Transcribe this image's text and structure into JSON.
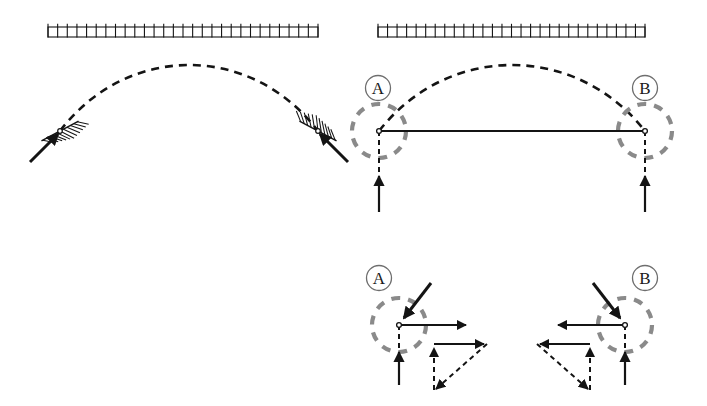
{
  "figure": {
    "colors": {
      "stroke": "#141414",
      "gray_dashed": "#8a8a8a",
      "label_circle": "#6e6e6e",
      "background": "#ffffff"
    }
  },
  "panels": [
    {
      "id": "panel-left",
      "name": "arch-on-fixed-abutments",
      "caption": "",
      "ceiling": {
        "name": "hatched-ground-bar",
        "x": 48,
        "y": 27,
        "width": 270,
        "height": 10,
        "tick_count": 28
      },
      "arch": {
        "name": "dashed-arch-curve",
        "start": [
          60,
          131
        ],
        "apex": [
          189,
          49
        ],
        "end": [
          318,
          131
        ],
        "style": "dashed"
      },
      "supports": [
        {
          "name": "left-inclined-abutment",
          "joint": [
            60,
            131
          ],
          "hatch_angle_deg": -28,
          "thrust_arrow": {
            "from": [
              30,
              162
            ],
            "to": [
              58,
              134
            ],
            "style": "solid"
          }
        },
        {
          "name": "right-inclined-abutment",
          "joint": [
            318,
            131
          ],
          "hatch_angle_deg": 28,
          "thrust_arrow": {
            "from": [
              348,
              162
            ],
            "to": [
              320,
              134
            ],
            "style": "solid"
          }
        }
      ]
    },
    {
      "id": "panel-right",
      "name": "tied-arch-with-reactions",
      "caption": "",
      "ceiling": {
        "name": "hatched-ground-bar",
        "x": 378,
        "y": 27,
        "width": 267,
        "height": 10,
        "tick_count": 28
      },
      "arch": {
        "name": "dashed-arch-curve",
        "start": [
          379,
          131
        ],
        "apex": [
          512,
          49
        ],
        "end": [
          645,
          131
        ],
        "style": "dashed"
      },
      "tie_rod": {
        "name": "horizontal-tie-rod",
        "from": [
          379,
          131
        ],
        "to": [
          645,
          131
        ],
        "style": "solid"
      },
      "joints": [
        {
          "name": "joint-a",
          "label": "A",
          "label_pos": [
            378,
            88
          ],
          "center": [
            379,
            131
          ],
          "circle_radius": 27
        },
        {
          "name": "joint-b",
          "label": "B",
          "label_pos": [
            645,
            88
          ],
          "center": [
            645,
            131
          ],
          "circle_radius": 27
        }
      ],
      "reactions": [
        {
          "name": "reaction-arrow-a",
          "dashed_line": {
            "from": [
              379,
              131
            ],
            "to": [
              379,
              205
            ]
          },
          "arrow": {
            "from": [
              379,
              212
            ],
            "to": [
              379,
              176
            ]
          }
        },
        {
          "name": "reaction-arrow-b",
          "dashed_line": {
            "from": [
              645,
              131
            ],
            "to": [
              645,
              205
            ]
          },
          "arrow": {
            "from": [
              645,
              212
            ],
            "to": [
              645,
              176
            ]
          }
        }
      ]
    },
    {
      "id": "panel-detail-a",
      "name": "free-body-detail-a",
      "label": "A",
      "label_pos": [
        379,
        278
      ],
      "center": [
        399,
        325
      ],
      "circle_radius": 27,
      "forces": {
        "applied_thrust": {
          "name": "arch-thrust-arrow",
          "from": [
            431,
            283
          ],
          "to": [
            404,
            318
          ],
          "style": "solid"
        },
        "tie_force": {
          "name": "tie-force-arrow",
          "from": [
            399,
            325
          ],
          "to": [
            466,
            325
          ],
          "style": "solid"
        },
        "reaction_vertical": {
          "name": "vertical-reaction-arrow",
          "dashed_line": {
            "from": [
              399,
              325
            ],
            "to": [
              399,
              358
            ]
          },
          "arrow": {
            "from": [
              399,
              385
            ],
            "to": [
              399,
              352
            ]
          }
        }
      },
      "triangle": {
        "name": "force-triangle-a",
        "vertices": [
          [
            434,
            344
          ],
          [
            434,
            390
          ],
          [
            487,
            344
          ]
        ],
        "edges": [
          {
            "name": "vertical-component",
            "from": [
              434,
              390
            ],
            "to": [
              434,
              348
            ],
            "style": "dashed-shaft-solid-head"
          },
          {
            "name": "horizontal-component",
            "from": [
              434,
              344
            ],
            "to": [
              484,
              344
            ],
            "style": "solid"
          },
          {
            "name": "resultant",
            "from": [
              487,
              344
            ],
            "to": [
              436,
              389
            ],
            "style": "dashed"
          }
        ]
      }
    },
    {
      "id": "panel-detail-b",
      "name": "free-body-detail-b",
      "label": "B",
      "label_pos": [
        645,
        278
      ],
      "center": [
        625,
        325
      ],
      "circle_radius": 27,
      "forces": {
        "applied_thrust": {
          "name": "arch-thrust-arrow",
          "from": [
            593,
            283
          ],
          "to": [
            620,
            318
          ],
          "style": "solid"
        },
        "tie_force": {
          "name": "tie-force-arrow",
          "from": [
            625,
            325
          ],
          "to": [
            558,
            325
          ],
          "style": "solid"
        },
        "reaction_vertical": {
          "name": "vertical-reaction-arrow",
          "dashed_line": {
            "from": [
              625,
              325
            ],
            "to": [
              625,
              358
            ]
          },
          "arrow": {
            "from": [
              625,
              385
            ],
            "to": [
              625,
              352
            ]
          }
        }
      },
      "triangle": {
        "name": "force-triangle-b",
        "vertices": [
          [
            590,
            344
          ],
          [
            590,
            390
          ],
          [
            537,
            344
          ]
        ],
        "edges": [
          {
            "name": "vertical-component",
            "from": [
              590,
              390
            ],
            "to": [
              590,
              348
            ],
            "style": "dashed-shaft-solid-head"
          },
          {
            "name": "horizontal-component",
            "from": [
              590,
              344
            ],
            "to": [
              540,
              344
            ],
            "style": "solid"
          },
          {
            "name": "resultant",
            "from": [
              537,
              344
            ],
            "to": [
              588,
              389
            ],
            "style": "dashed"
          }
        ]
      }
    }
  ],
  "annotations": {
    "label_a": "A",
    "label_b": "B",
    "label_a_detail": "A",
    "label_b_detail": "B"
  }
}
